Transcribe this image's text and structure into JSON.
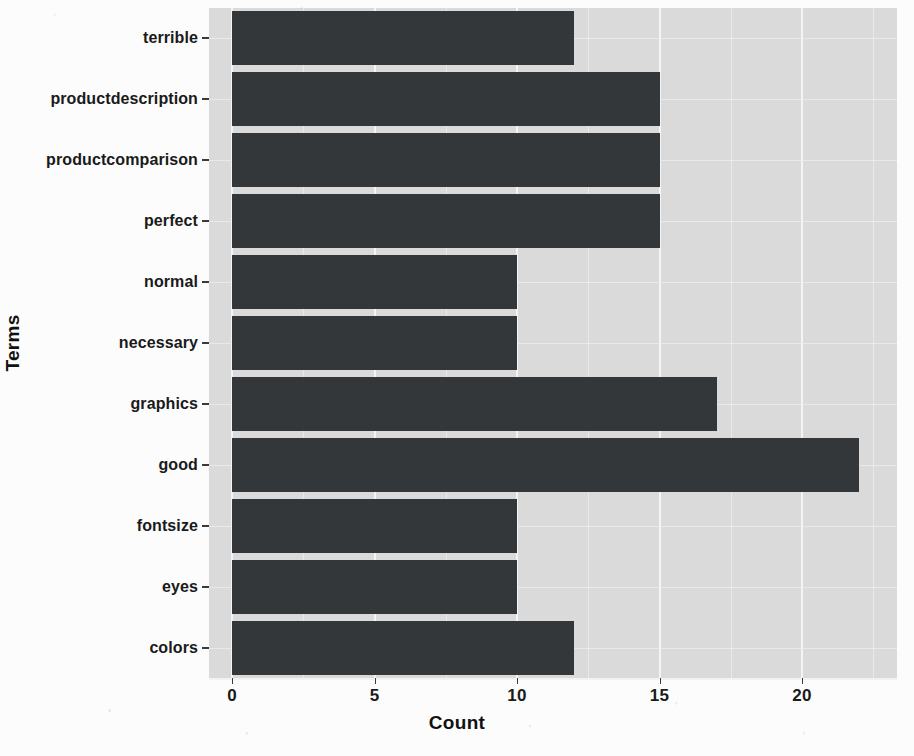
{
  "chart_data": {
    "type": "bar",
    "orientation": "horizontal",
    "title": "",
    "xlabel": "Count",
    "ylabel": "Terms",
    "xlim": [
      0,
      23.1
    ],
    "xticks": [
      0,
      5,
      10,
      15,
      20
    ],
    "xtick_labels": [
      "0",
      "5",
      "10",
      "15",
      "20"
    ],
    "grid": true,
    "grid_color": "#f4f4f4",
    "panel_background": "#dadada",
    "bar_color": "#343739",
    "legend": null,
    "categories": [
      "terrible",
      "productdescription",
      "productcomparison",
      "perfect",
      "normal",
      "necessary",
      "graphics",
      "good",
      "fontsize",
      "eyes",
      "colors"
    ],
    "values": [
      12,
      15,
      15,
      15,
      10,
      10,
      17,
      22,
      10,
      10,
      12
    ],
    "bars": [
      {
        "label": "terrible",
        "value": 12
      },
      {
        "label": "productdescription",
        "value": 15
      },
      {
        "label": "productcomparison",
        "value": 15
      },
      {
        "label": "perfect",
        "value": 15
      },
      {
        "label": "normal",
        "value": 10
      },
      {
        "label": "necessary",
        "value": 10
      },
      {
        "label": "graphics",
        "value": 17
      },
      {
        "label": "good",
        "value": 22
      },
      {
        "label": "fontsize",
        "value": 10
      },
      {
        "label": "eyes",
        "value": 10
      },
      {
        "label": "colors",
        "value": 12
      }
    ]
  },
  "axes": {
    "x_title": "Count",
    "y_title": "Terms"
  }
}
